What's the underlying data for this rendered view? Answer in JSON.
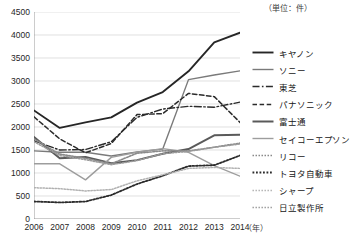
{
  "unit_note": "（単位：件）",
  "xaxis_unit": "（年）",
  "axes": {
    "y_ticks": [
      "0",
      "500",
      "1000",
      "1500",
      "2000",
      "2500",
      "3000",
      "3500",
      "4000",
      "4500"
    ],
    "x_ticks": [
      "2006",
      "2007",
      "2008",
      "2009",
      "2010",
      "2011",
      "2012",
      "2013",
      "2014"
    ]
  },
  "legend": {
    "items": [
      {
        "label": "キヤノン",
        "style": "solid-dark",
        "color": "#262626"
      },
      {
        "label": "ソニー",
        "style": "solid-gray",
        "color": "#7a7a7a"
      },
      {
        "label": "東芝",
        "style": "dashdot",
        "color": "#2b2b2b"
      },
      {
        "label": "パナソニック",
        "style": "dashed",
        "color": "#2b2b2b"
      },
      {
        "label": "富士通",
        "style": "solid-thick",
        "color": "#5a5a5a"
      },
      {
        "label": "セイコーエプソン",
        "style": "solid-light",
        "color": "#9d9d9d"
      },
      {
        "label": "リコー",
        "style": "dotted-fine",
        "color": "#8a8a8a"
      },
      {
        "label": "トヨタ自動車",
        "style": "dotted-bold",
        "color": "#2b2b2b"
      },
      {
        "label": "シャープ",
        "style": "dotted-light",
        "color": "#b0b0b0"
      },
      {
        "label": "日立製作所",
        "style": "dotted-mid",
        "color": "#9a9a9a"
      }
    ]
  },
  "chart_data": {
    "type": "line",
    "title": "",
    "xlabel": "（年）",
    "ylabel": "",
    "unit": "件",
    "grid": true,
    "legend_position": "right",
    "x": [
      2006,
      2007,
      2008,
      2009,
      2010,
      2011,
      2012,
      2013,
      2014
    ],
    "xlim": [
      2006,
      2014
    ],
    "ylim": [
      0,
      4500
    ],
    "ytick_step": 500,
    "series": [
      {
        "name": "キヤノン",
        "style": "solid-dark",
        "color": "#262626",
        "width": 1.9,
        "values": [
          2360,
          1980,
          2100,
          2210,
          2530,
          2760,
          3210,
          3840,
          4050
        ]
      },
      {
        "name": "ソニー",
        "style": "solid-gray",
        "color": "#7a7a7a",
        "width": 1.4,
        "values": [
          1480,
          1450,
          1450,
          1370,
          1460,
          1520,
          3030,
          3130,
          3220
        ]
      },
      {
        "name": "東芝",
        "style": "dashdot",
        "color": "#2b2b2b",
        "width": 1.4,
        "values": [
          1700,
          1500,
          1510,
          1680,
          2210,
          2390,
          2450,
          2430,
          2540
        ]
      },
      {
        "name": "パナソニック",
        "style": "dashed",
        "color": "#2b2b2b",
        "width": 1.5,
        "values": [
          2220,
          1740,
          1440,
          1640,
          2270,
          2290,
          2730,
          2660,
          2100
        ]
      },
      {
        "name": "富士通",
        "style": "solid-thick",
        "color": "#5a5a5a",
        "width": 2.0,
        "values": [
          1780,
          1320,
          1350,
          1210,
          1280,
          1420,
          1520,
          1820,
          1830
        ]
      },
      {
        "name": "セイコーエプソン",
        "style": "solid-light",
        "color": "#9d9d9d",
        "width": 1.4,
        "values": [
          1200,
          1200,
          850,
          1340,
          1450,
          1530,
          1450,
          1160,
          930
        ]
      },
      {
        "name": "リコー",
        "style": "dotted-fine",
        "color": "#8a8a8a",
        "width": 1.6,
        "values": [
          1740,
          1410,
          1320,
          1200,
          1430,
          1480,
          1480,
          1560,
          1650
        ]
      },
      {
        "name": "トヨタ自動車",
        "style": "dotted-bold",
        "color": "#2b2b2b",
        "width": 1.8,
        "values": [
          380,
          360,
          380,
          520,
          760,
          940,
          1150,
          1170,
          1380
        ]
      },
      {
        "name": "シャープ",
        "style": "dotted-light",
        "color": "#b0b0b0",
        "width": 1.5,
        "values": [
          680,
          660,
          610,
          640,
          830,
          960,
          1100,
          1120,
          1100
        ]
      },
      {
        "name": "日立製作所",
        "style": "dotted-mid",
        "color": "#9a9a9a",
        "width": 1.5,
        "values": [
          1680,
          1380,
          1290,
          1180,
          1270,
          1420,
          1470,
          1560,
          1630
        ]
      }
    ]
  }
}
